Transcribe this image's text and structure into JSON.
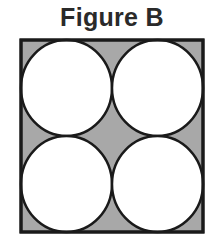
{
  "title": "Figure B",
  "colors": {
    "shaded_region": "#a8a8a8",
    "circle_fill": "#ffffff",
    "stroke": "#1a1a1a",
    "title_text": "#2a2a2a"
  },
  "diagram": {
    "shape": "square",
    "circles": [
      {
        "position": "top-left"
      },
      {
        "position": "top-right"
      },
      {
        "position": "bottom-left"
      },
      {
        "position": "bottom-right"
      }
    ]
  }
}
